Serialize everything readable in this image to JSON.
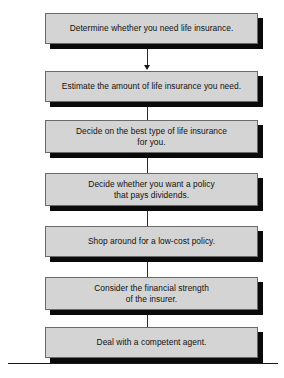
{
  "diagram": {
    "orientation": "vertical top-to-bottom",
    "colors": {
      "box_fill": "#d4d4d4",
      "box_border": "#6a6a6a",
      "box_shadow": "#0a0a0a",
      "text": "#111111",
      "connector": "#2b2b2b",
      "rule": "#1a1a1a"
    },
    "steps": [
      {
        "index": "1",
        "label": "Determine whether you need life insurance.",
        "lines": 1
      },
      {
        "index": "2",
        "label": "Estimate the amount of life insurance you need.",
        "lines": 1
      },
      {
        "index": "3",
        "label": "Decide on the best type of life insurance\nfor you.",
        "lines": 2
      },
      {
        "index": "4",
        "label": "Decide whether you want a policy\nthat pays dividends.",
        "lines": 2
      },
      {
        "index": "5",
        "label": "Shop around for a low-cost policy.",
        "lines": 1
      },
      {
        "index": "6",
        "label": "Consider the financial strength\nof the insurer.",
        "lines": 2
      },
      {
        "index": "7",
        "label": "Deal with a competent agent.",
        "lines": 1
      }
    ],
    "connector_count": 6,
    "bottom_rule": true
  }
}
